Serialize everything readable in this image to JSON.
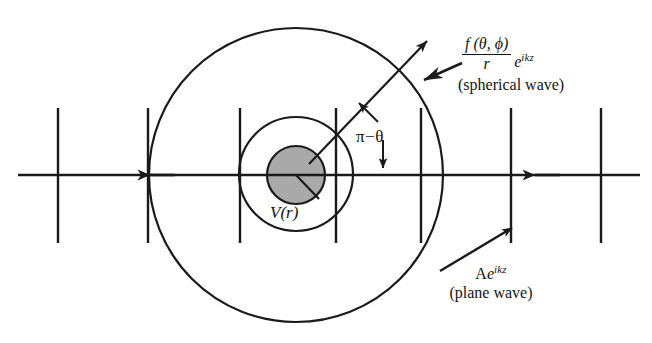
{
  "figure": {
    "stroke_color": "#1a1a1a",
    "core_fill_color": "#a9a9a9",
    "background_color": "#ffffff"
  },
  "labels": {
    "potential": "V(r)",
    "angle": "π−θ",
    "spherical": {
      "numerator": "f (θ, ϕ)",
      "denominator": "r",
      "exp_base": "e",
      "exp_superscript": "ikz",
      "caption": "(spherical wave)"
    },
    "plane": {
      "amplitude": "A",
      "exp_base": "e",
      "exp_superscript": "ikz",
      "caption": "(plane wave)"
    }
  },
  "geometry": {
    "center": {
      "x": 296,
      "y": 175
    },
    "outer_circle_radius": 147,
    "middle_circle_radius": 57,
    "core_disk_radius": 29,
    "axis": {
      "y": 175,
      "x_start": 18,
      "x_end": 640
    },
    "axis_arrow_positions": [
      155,
      340
    ],
    "wavefront_lines_x": [
      58,
      148,
      240,
      336,
      421,
      511,
      601
    ],
    "wavefront_line_top": 108,
    "wavefront_line_bottom": 243,
    "scattered_ray": {
      "x1": 309,
      "y1": 164,
      "x2": 428,
      "y2": 40
    }
  }
}
